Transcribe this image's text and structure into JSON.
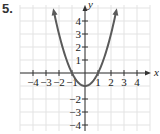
{
  "problem": {
    "number": "5."
  },
  "chart_data": {
    "type": "line",
    "title": "",
    "xlabel": "x",
    "ylabel": "y",
    "xlim": [
      -5,
      5
    ],
    "ylim": [
      -4.5,
      5
    ],
    "grid": true,
    "x_ticks": [
      -4,
      -3,
      -2,
      -1,
      1,
      2,
      3,
      4
    ],
    "y_ticks": [
      4,
      3,
      2,
      1,
      -2,
      -3,
      -4
    ],
    "x_tick_labels": [
      "−4",
      "−3",
      "−2",
      "−1",
      "1",
      "2",
      "3",
      "4"
    ],
    "y_tick_labels": [
      "4",
      "3",
      "2",
      "1",
      "−2",
      "−3",
      "−4"
    ],
    "series": [
      {
        "name": "y = x^2 - 1",
        "color": "#5a5a5a",
        "arrows_at_ends": true,
        "x": [
          -2.4,
          -2,
          -1.5,
          -1,
          -0.5,
          0,
          0.5,
          1,
          1.5,
          2,
          2.4
        ],
        "y": [
          4.76,
          3,
          1.25,
          0,
          -0.75,
          -1,
          -0.75,
          0,
          1.25,
          3,
          4.76
        ]
      }
    ],
    "colors": {
      "grid": "#e3e3e3",
      "axis": "#333333",
      "curve": "#5a5a5a"
    }
  }
}
